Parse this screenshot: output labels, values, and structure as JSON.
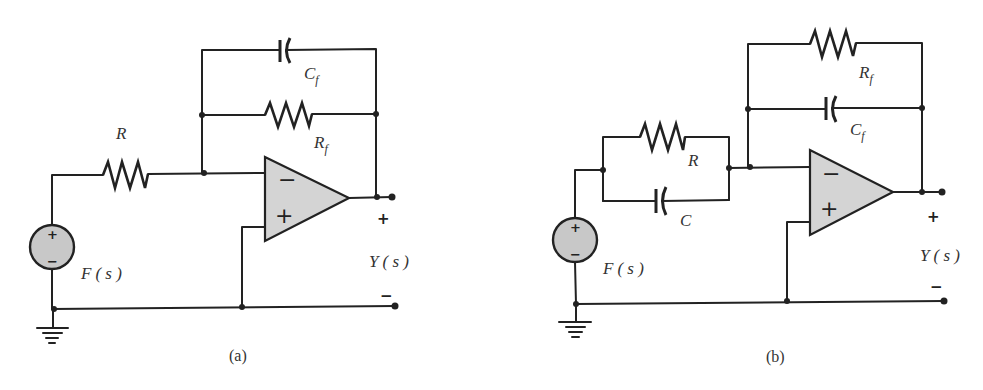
{
  "figure": {
    "circuits": [
      {
        "id": "a",
        "caption": "(a)",
        "source_label": "F",
        "source_arg": "( s )",
        "source_plus": "+",
        "source_minus": "−",
        "input_resistor": "R",
        "feedback_capacitor": "C",
        "feedback_capacitor_sub": "f",
        "feedback_resistor": "R",
        "feedback_resistor_sub": "f",
        "opamp_minus": "−",
        "opamp_plus": "+",
        "output_label": "Y",
        "output_arg": "( s )",
        "output_plus": "+",
        "output_minus": "−"
      },
      {
        "id": "b",
        "caption": "(b)",
        "source_label": "F",
        "source_arg": "( s )",
        "source_plus": "+",
        "source_minus": "−",
        "input_resistor": "R",
        "input_capacitor": "C",
        "feedback_resistor": "R",
        "feedback_resistor_sub": "f",
        "feedback_capacitor": "C",
        "feedback_capacitor_sub": "f",
        "opamp_minus": "−",
        "opamp_plus": "+",
        "output_label": "Y",
        "output_arg": "( s )",
        "output_plus": "+",
        "output_minus": "−"
      }
    ],
    "colors": {
      "wire": "#222222",
      "opamp_fill": "#d4d4d4",
      "source_fill": "#c8c8c8",
      "text": "#333333"
    }
  }
}
